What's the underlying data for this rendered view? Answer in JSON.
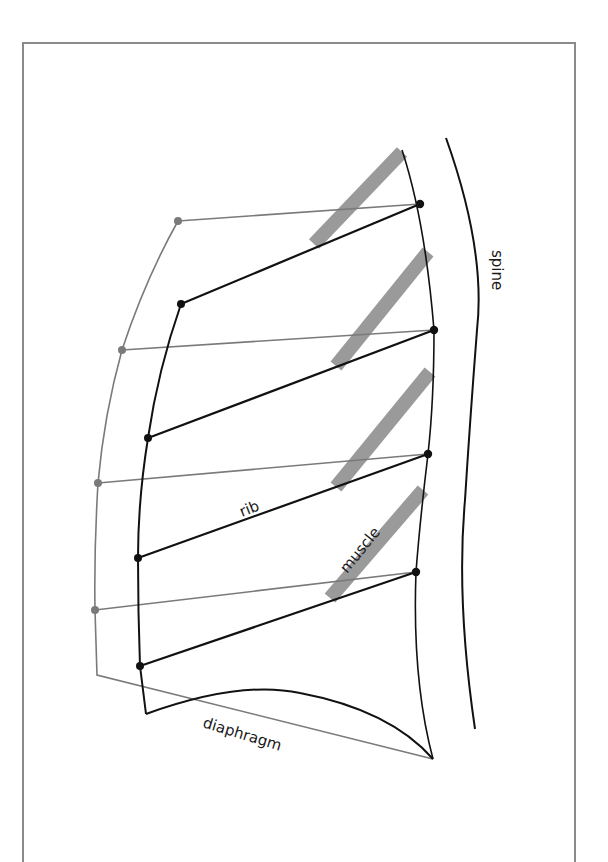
{
  "figure": {
    "labels": {
      "spine": "spine",
      "rib": "rib",
      "muscle": "muscle",
      "diaphragm": "diaphragm"
    },
    "colors": {
      "frame": "#8a8a8a",
      "black_line": "#111111",
      "gray_line": "#7a7a7a",
      "muscle_band": "#9a9a9a",
      "background": "#ffffff"
    },
    "black_ribs": [
      {
        "inner": [
          181,
          304
        ],
        "outer": [
          420,
          204
        ]
      },
      {
        "inner": [
          148,
          438
        ],
        "outer": [
          434,
          330
        ]
      },
      {
        "inner": [
          138,
          558
        ],
        "outer": [
          428,
          454
        ]
      },
      {
        "inner": [
          140,
          666
        ],
        "outer": [
          416,
          572
        ]
      }
    ],
    "gray_ribs": [
      {
        "inner": [
          178,
          221
        ],
        "outer": [
          420,
          204
        ]
      },
      {
        "inner": [
          122,
          350
        ],
        "outer": [
          434,
          330
        ]
      },
      {
        "inner": [
          98,
          483
        ],
        "outer": [
          428,
          454
        ]
      },
      {
        "inner": [
          95,
          610
        ],
        "outer": [
          416,
          572
        ]
      }
    ],
    "muscle_bands": [
      {
        "from": [
          314,
          244
        ],
        "to": [
          402,
          152
        ]
      },
      {
        "from": [
          336,
          366
        ],
        "to": [
          428,
          252
        ]
      },
      {
        "from": [
          336,
          487
        ],
        "to": [
          430,
          372
        ]
      },
      {
        "from": [
          330,
          598
        ],
        "to": [
          423,
          490
        ]
      }
    ]
  }
}
